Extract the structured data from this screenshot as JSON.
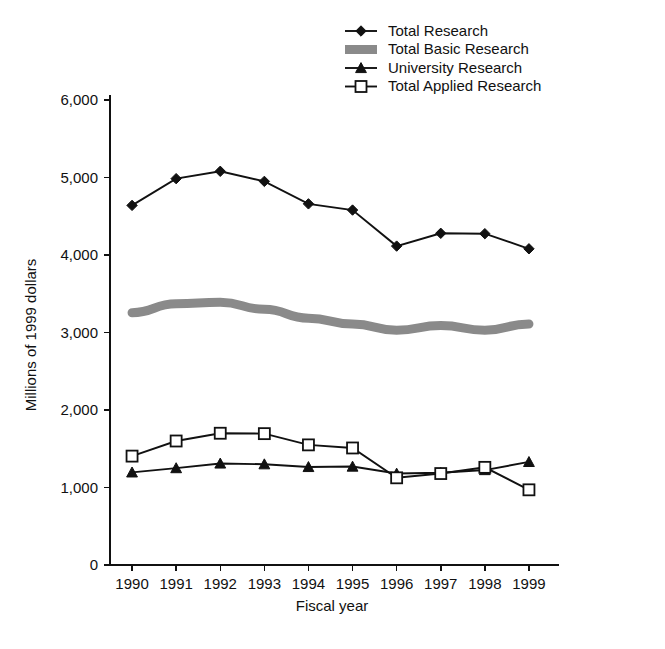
{
  "chart_data": {
    "type": "line",
    "title": "",
    "xlabel": "Fiscal year",
    "ylabel": "Millions of 1999 dollars",
    "categories": [
      "1990",
      "1991",
      "1992",
      "1993",
      "1994",
      "1995",
      "1996",
      "1997",
      "1998",
      "1999"
    ],
    "ylim": [
      0,
      6000
    ],
    "y_ticks": [
      "0",
      "1,000",
      "2,000",
      "3,000",
      "4,000",
      "5,000",
      "6,000"
    ],
    "y_tick_values": [
      0,
      1000,
      2000,
      3000,
      4000,
      5000,
      6000
    ],
    "grid": false,
    "legend_position": "top-right",
    "series": [
      {
        "name": "Total Research",
        "marker": "diamond",
        "style": "line-marker",
        "color": "#111111",
        "values": [
          4640,
          4985,
          5080,
          4950,
          4660,
          4580,
          4115,
          4280,
          4275,
          4080
        ]
      },
      {
        "name": "Total Basic Research",
        "marker": "band",
        "style": "thick-gray-band",
        "color": "#8a8a8a",
        "values": [
          3255,
          3370,
          3390,
          3300,
          3185,
          3110,
          3030,
          3090,
          3030,
          3110
        ]
      },
      {
        "name": "University Research",
        "marker": "triangle",
        "style": "line-marker",
        "color": "#111111",
        "values": [
          1195,
          1250,
          1310,
          1300,
          1265,
          1270,
          1180,
          1190,
          1225,
          1330
        ]
      },
      {
        "name": "Total Applied Research",
        "marker": "square",
        "style": "line-marker",
        "color": "#111111",
        "values": [
          1405,
          1600,
          1700,
          1695,
          1550,
          1510,
          1125,
          1180,
          1260,
          970
        ]
      }
    ]
  },
  "legend": {
    "entries": [
      {
        "label": "Total Research",
        "marker": "diamond"
      },
      {
        "label": "Total Basic Research",
        "marker": "band"
      },
      {
        "label": "University Research",
        "marker": "triangle"
      },
      {
        "label": "Total Applied Research",
        "marker": "square"
      }
    ]
  }
}
